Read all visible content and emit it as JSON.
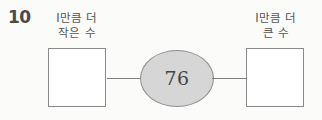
{
  "problem": {
    "number": "10",
    "type": "number-relation-diagram"
  },
  "labels": {
    "left": {
      "line1": "I만큼 더",
      "line2": "작은 수"
    },
    "right": {
      "line1": "I만큼 더",
      "line2": "큰 수"
    }
  },
  "center": {
    "value": "76"
  },
  "answers": {
    "left_box_value": "",
    "right_box_value": ""
  },
  "colors": {
    "background": "#fbfbfa",
    "ellipse_fill": "#d6d6d6",
    "ellipse_border": "#8e8e8e",
    "box_border": "#8a8a8a",
    "connector": "#7d7d7d",
    "text": "#555555",
    "number_text": "#4a4a4a",
    "value_text": "#454545"
  }
}
